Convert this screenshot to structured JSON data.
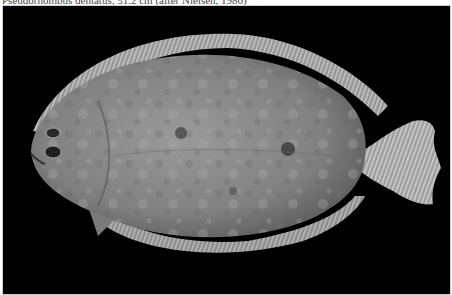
{
  "caption": "Pseudorhombus dentatus, 51.2 cm (after Nielsen, 1986)",
  "photo": {
    "subject": "flatfish (flounder) specimen, left-side view",
    "background_color": "#000000",
    "body_color": "#8a8a8a",
    "fin_color": "#b5b5b5"
  }
}
